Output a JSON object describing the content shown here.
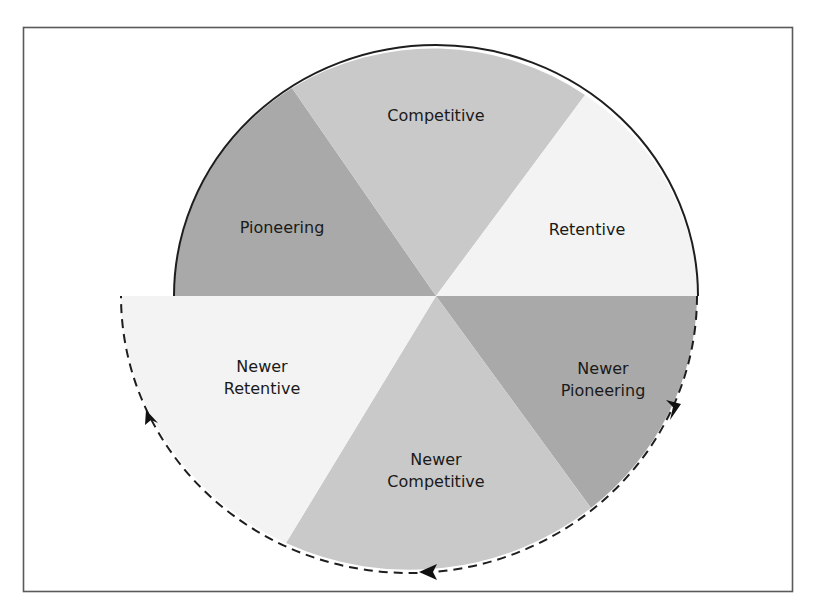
{
  "diagram": {
    "type": "cycle-wheel",
    "center": {
      "x": 436,
      "y": 296
    },
    "colors": {
      "frame": "#5a5a5a",
      "pioneering": "#a9a9a9",
      "competitive": "#c9c9c9",
      "retentive": "#f3f3f3",
      "outline": "#1e1e1e",
      "text": "#1a1a1a"
    },
    "segments": [
      {
        "id": "pioneering",
        "lines": [
          "Pioneering"
        ],
        "half": "top",
        "shade": "dark"
      },
      {
        "id": "competitive",
        "lines": [
          "Competitive"
        ],
        "half": "top",
        "shade": "medium"
      },
      {
        "id": "retentive",
        "lines": [
          "Retentive"
        ],
        "half": "top",
        "shade": "light"
      },
      {
        "id": "newer-pioneering",
        "lines": [
          "Newer",
          "Pioneering"
        ],
        "half": "bottom",
        "shade": "dark"
      },
      {
        "id": "newer-competitive",
        "lines": [
          "Newer",
          "Competitive"
        ],
        "half": "bottom",
        "shade": "medium"
      },
      {
        "id": "newer-retentive",
        "lines": [
          "Newer",
          "Retentive"
        ],
        "half": "bottom",
        "shade": "light"
      }
    ],
    "top_outline": "solid",
    "bottom_outline": "dashed",
    "arrows": [
      {
        "position": "right",
        "direction": "down"
      },
      {
        "position": "bottom",
        "direction": "left"
      },
      {
        "position": "left",
        "direction": "up"
      }
    ]
  }
}
